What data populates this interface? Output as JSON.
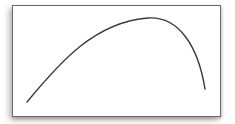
{
  "diagram": {
    "type": "framed-curve",
    "frame_color": "#6a6a6a",
    "curve_color": "#3a3a3a",
    "curve": {
      "start": [
        27,
        102
      ],
      "control1": [
        80,
        40
      ],
      "peak": [
        150,
        18
      ],
      "control2": [
        185,
        22
      ],
      "end": [
        205,
        89
      ]
    }
  }
}
